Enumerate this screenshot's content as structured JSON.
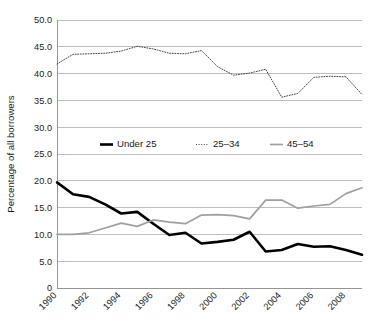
{
  "chart_data": {
    "type": "line",
    "title": "",
    "xlabel": "",
    "ylabel": "Percentage of all borrowers",
    "ylim": [
      0,
      50
    ],
    "xlim": [
      1990,
      2009
    ],
    "grid": "horizontal",
    "legend_position": "inside-middle-left",
    "y_ticks": [
      "0",
      "5.0",
      "10.0",
      "15.0",
      "20.0",
      "25.0",
      "30.0",
      "35.0",
      "40.0",
      "45.0",
      "50.0"
    ],
    "y_tick_values": [
      0,
      5,
      10,
      15,
      20,
      25,
      30,
      35,
      40,
      45,
      50
    ],
    "x_ticks": [
      "1990",
      "1992",
      "1994",
      "1996",
      "1998",
      "2000",
      "2002",
      "2004",
      "2006",
      "2008"
    ],
    "x_tick_values": [
      1990,
      1992,
      1994,
      1996,
      1998,
      2000,
      2002,
      2004,
      2006,
      2008
    ],
    "x": [
      1990,
      1991,
      1992,
      1993,
      1994,
      1995,
      1996,
      1997,
      1998,
      1999,
      2000,
      2001,
      2002,
      2003,
      2004,
      2005,
      2006,
      2007,
      2008,
      2009
    ],
    "series": [
      {
        "name": "Under 25",
        "style": "solid",
        "color": "#000000",
        "width": 2.6,
        "values": [
          19.7,
          17.5,
          17.0,
          15.6,
          13.9,
          14.2,
          12.0,
          9.9,
          10.3,
          8.3,
          8.6,
          9.0,
          10.5,
          6.8,
          7.1,
          8.2,
          7.7,
          7.8,
          7.1,
          6.2
        ]
      },
      {
        "name": "25–34",
        "style": "dotted",
        "color": "#333333",
        "width": 0.9,
        "values": [
          41.8,
          43.6,
          43.7,
          43.8,
          44.2,
          45.1,
          44.6,
          43.8,
          43.7,
          44.3,
          41.3,
          39.7,
          40.1,
          40.8,
          35.6,
          36.3,
          39.3,
          39.5,
          39.4,
          36.1
        ]
      },
      {
        "name": "45–54",
        "style": "solid",
        "color": "#a0a0a0",
        "width": 1.7,
        "values": [
          10.0,
          10.0,
          10.3,
          11.2,
          12.1,
          11.5,
          12.7,
          12.3,
          12.0,
          13.6,
          13.7,
          13.5,
          12.9,
          16.4,
          16.4,
          14.9,
          15.3,
          15.6,
          17.6,
          18.7
        ]
      }
    ]
  },
  "legend": {
    "items": [
      {
        "label": "Under 25"
      },
      {
        "label": "25–34"
      },
      {
        "label": "45–54"
      }
    ]
  }
}
